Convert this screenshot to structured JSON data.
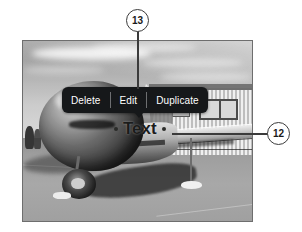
{
  "figure": {
    "type": "diagram"
  },
  "photo": {
    "alt": "black and white photo of a vintage single-engine airplane parked on a tarmac in front of a building, with sky and clouds above"
  },
  "context_menu": {
    "items": [
      {
        "label": "Delete",
        "name": "delete"
      },
      {
        "label": "Edit",
        "name": "edit"
      },
      {
        "label": "Duplicate",
        "name": "duplicate"
      }
    ],
    "background_color": "#16181a",
    "text_color": "#ffffff"
  },
  "text_object": {
    "value": "Text",
    "selected": true,
    "color": "#1b1c1b"
  },
  "callouts": [
    {
      "number": "13",
      "target": "context-menu",
      "leader": "vertical"
    },
    {
      "number": "12",
      "target": "text-object",
      "leader": "horizontal"
    }
  ]
}
